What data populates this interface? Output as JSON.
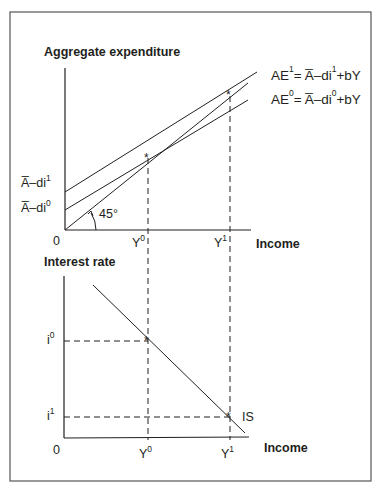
{
  "top_panel": {
    "y_axis_label": "Aggregate expenditure",
    "x_axis_label": "Income",
    "origin_label": "0",
    "angle_label": "45°",
    "intercept_labels": [
      {
        "base": "A̅–di",
        "sup": "1"
      },
      {
        "base": "A̅–di",
        "sup": "0"
      }
    ],
    "x_ticks": [
      {
        "base": "Y",
        "sup": "0"
      },
      {
        "base": "Y",
        "sup": "1"
      }
    ],
    "equations": [
      {
        "lhs": "AE",
        "lhs_sup": "1",
        "rhs_a": "= A̅–di",
        "rhs_sup": "1",
        "rhs_b": "+bY"
      },
      {
        "lhs": "AE",
        "lhs_sup": "0",
        "rhs_a": "= A̅–di",
        "rhs_sup": "0",
        "rhs_b": "+bY"
      }
    ]
  },
  "bottom_panel": {
    "y_axis_label": "Interest rate",
    "x_axis_label": "Income",
    "origin_label": "0",
    "curve_label": "IS",
    "y_ticks": [
      {
        "base": "i",
        "sup": "0"
      },
      {
        "base": "i",
        "sup": "1"
      }
    ],
    "x_ticks": [
      {
        "base": "Y",
        "sup": "0"
      },
      {
        "base": "Y",
        "sup": "1"
      }
    ]
  },
  "colors": {
    "line": "#231f20",
    "frame": "#444444"
  }
}
